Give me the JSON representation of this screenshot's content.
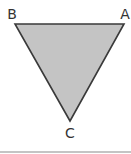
{
  "diagram": {
    "type": "triangle",
    "fill_color": "#c4c4c4",
    "stroke_color": "#3a3a3a",
    "vertices": [
      {
        "label": "A",
        "x": 124,
        "y": 24,
        "label_x": 125,
        "label_y": 19
      },
      {
        "label": "B",
        "x": 15,
        "y": 24,
        "label_x": 12,
        "label_y": 19
      },
      {
        "label": "C",
        "x": 70,
        "y": 121,
        "label_x": 70,
        "label_y": 138
      }
    ],
    "bottom_rule_color": "#b0b0b0"
  }
}
